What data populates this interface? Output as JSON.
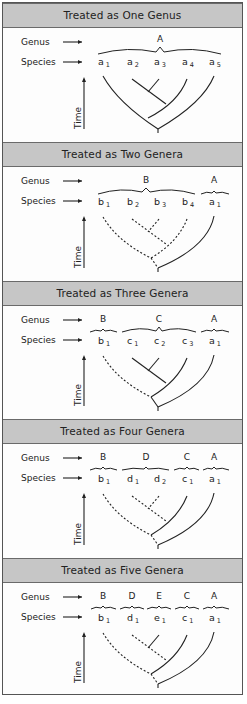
{
  "row_labels": {
    "genus": "Genus",
    "species": "Species",
    "time": "Time"
  },
  "panels": [
    {
      "title": "Treated as One Genus",
      "genera": [
        {
          "name": "A",
          "x": 157
        }
      ],
      "species": [
        {
          "letter": "a",
          "sub": "1",
          "x": 100
        },
        {
          "letter": "a",
          "sub": "2",
          "x": 129
        },
        {
          "letter": "a",
          "sub": "3",
          "x": 156
        },
        {
          "letter": "a",
          "sub": "4",
          "x": 184
        },
        {
          "letter": "a",
          "sub": "5",
          "x": 211
        }
      ]
    },
    {
      "title": "Treated as Two Genera",
      "genera": [
        {
          "name": "B",
          "x": 143
        },
        {
          "name": "A",
          "x": 211
        }
      ],
      "species": [
        {
          "letter": "b",
          "sub": "1",
          "x": 100
        },
        {
          "letter": "b",
          "sub": "2",
          "x": 129
        },
        {
          "letter": "b",
          "sub": "3",
          "x": 156
        },
        {
          "letter": "b",
          "sub": "4",
          "x": 184
        },
        {
          "letter": "a",
          "sub": "1",
          "x": 211
        }
      ]
    },
    {
      "title": "Treated as Three Genera",
      "genera": [
        {
          "name": "B",
          "x": 100
        },
        {
          "name": "C",
          "x": 156
        },
        {
          "name": "A",
          "x": 211
        }
      ],
      "species": [
        {
          "letter": "b",
          "sub": "1",
          "x": 100
        },
        {
          "letter": "c",
          "sub": "1",
          "x": 129
        },
        {
          "letter": "c",
          "sub": "2",
          "x": 156
        },
        {
          "letter": "c",
          "sub": "3",
          "x": 184
        },
        {
          "letter": "a",
          "sub": "1",
          "x": 211
        }
      ]
    },
    {
      "title": "Treated as Four Genera",
      "genera": [
        {
          "name": "B",
          "x": 100
        },
        {
          "name": "D",
          "x": 143
        },
        {
          "name": "C",
          "x": 184
        },
        {
          "name": "A",
          "x": 211
        }
      ],
      "species": [
        {
          "letter": "b",
          "sub": "1",
          "x": 100
        },
        {
          "letter": "d",
          "sub": "1",
          "x": 129
        },
        {
          "letter": "d",
          "sub": "2",
          "x": 156
        },
        {
          "letter": "c",
          "sub": "1",
          "x": 184
        },
        {
          "letter": "a",
          "sub": "1",
          "x": 211
        }
      ]
    },
    {
      "title": "Treated as Five Genera",
      "genera": [
        {
          "name": "B",
          "x": 100
        },
        {
          "name": "D",
          "x": 129
        },
        {
          "name": "E",
          "x": 156
        },
        {
          "name": "C",
          "x": 184
        },
        {
          "name": "A",
          "x": 211
        }
      ],
      "species": [
        {
          "letter": "b",
          "sub": "1",
          "x": 100
        },
        {
          "letter": "d",
          "sub": "1",
          "x": 129
        },
        {
          "letter": "e",
          "sub": "1",
          "x": 156
        },
        {
          "letter": "c",
          "sub": "1",
          "x": 184
        },
        {
          "letter": "a",
          "sub": "1",
          "x": 211
        }
      ]
    }
  ]
}
